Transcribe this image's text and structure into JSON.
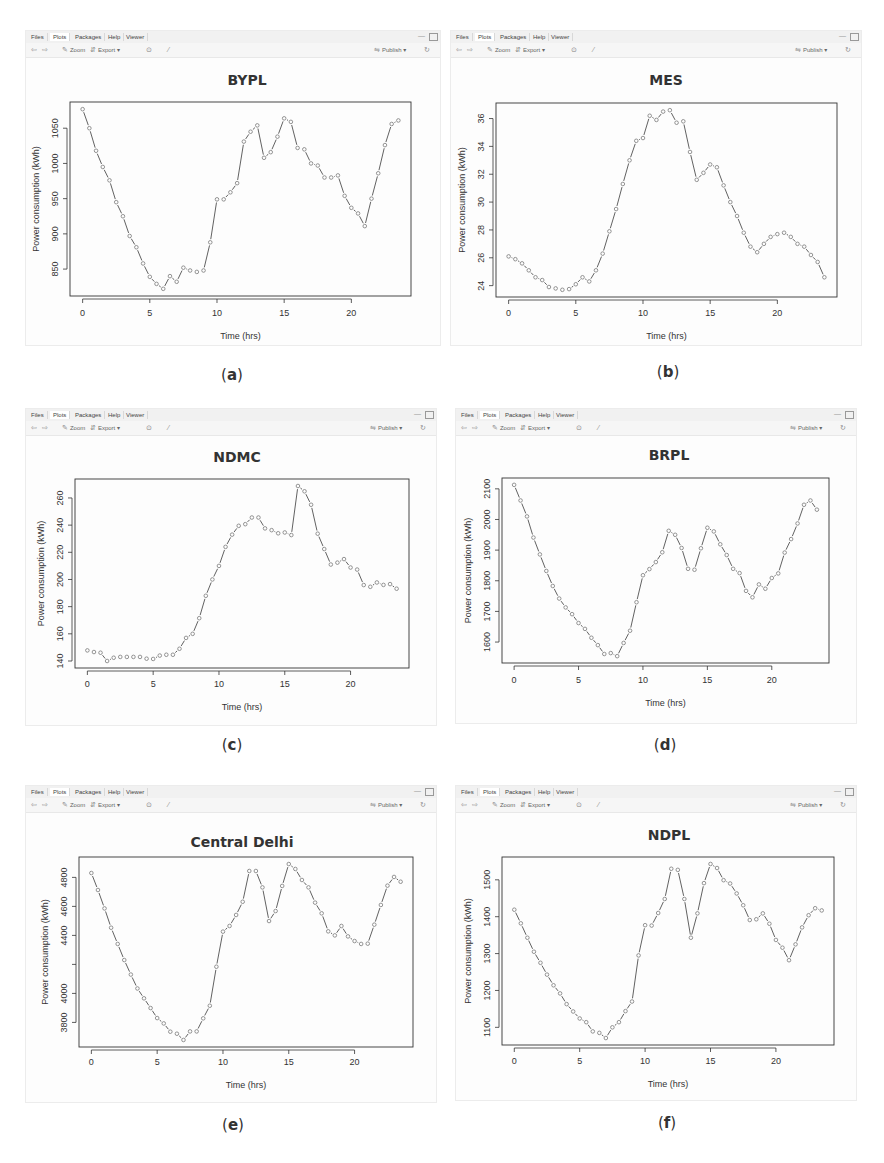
{
  "toolbar": {
    "tabs": [
      "Files",
      "Plots",
      "Packages",
      "Help",
      "Viewer"
    ],
    "active_tab": "Plots",
    "zoom_label": "Zoom",
    "export_label": "Export",
    "publish_label": "Publish",
    "dropdown_caret": "▾",
    "icons": {
      "back": "⇦",
      "forward": "⇨",
      "zoom": "✎",
      "export": "⇵",
      "remove": "⊙",
      "clear": "⁄",
      "publish": "⇋",
      "refresh": "↻",
      "minimize": "—"
    }
  },
  "panels": [
    {
      "caption": "a",
      "title": "BYPL"
    },
    {
      "caption": "b",
      "title": "MES"
    },
    {
      "caption": "c",
      "title": "NDMC"
    },
    {
      "caption": "d",
      "title": "BRPL"
    },
    {
      "caption": "e",
      "title": "Central Delhi"
    },
    {
      "caption": "f",
      "title": "NDPL"
    }
  ],
  "colors": {
    "line": "#3a3a3a",
    "point": "#7a7a7a",
    "axis": "#333333",
    "text": "#333333"
  },
  "chart_data": [
    {
      "type": "line",
      "title": "BYPL",
      "xlabel": "Time (hrs)",
      "ylabel": "Power consumption (kWh)",
      "x_ticks": [
        0,
        5,
        10,
        15,
        20
      ],
      "y_ticks": [
        850,
        900,
        950,
        1000,
        1050
      ],
      "y_tick_labels": [
        "850",
        "900",
        "950",
        "1000",
        "1050"
      ],
      "x": [
        0,
        0.5,
        1,
        1.5,
        2,
        2.5,
        3,
        3.5,
        4,
        4.5,
        5,
        5.5,
        6,
        6.5,
        7,
        7.5,
        8,
        8.5,
        9,
        9.5,
        10,
        10.5,
        11,
        11.5,
        12,
        12.5,
        13,
        13.5,
        14,
        14.5,
        15,
        15.5,
        16,
        16.5,
        17,
        17.5,
        18,
        18.5,
        19,
        19.5,
        20,
        20.5,
        21,
        21.5,
        22,
        22.5,
        23,
        23.5
      ],
      "values": [
        1077,
        1050,
        1018,
        995,
        976,
        945,
        925,
        897,
        881,
        858,
        839,
        829,
        822,
        840,
        832,
        852,
        848,
        846,
        848,
        888,
        949,
        949,
        959,
        972,
        1031,
        1045,
        1054,
        1008,
        1016,
        1038,
        1064,
        1059,
        1022,
        1020,
        1000,
        997,
        980,
        980,
        983,
        954,
        937,
        929,
        911,
        950,
        986,
        1026,
        1056,
        1061
      ],
      "grid": false,
      "legend": false
    },
    {
      "type": "line",
      "title": "MES",
      "xlabel": "Time (hrs)",
      "ylabel": "Power consumption (kWh)",
      "x_ticks": [
        0,
        5,
        10,
        15,
        20
      ],
      "y_ticks": [
        24,
        26,
        28,
        30,
        32,
        34,
        36
      ],
      "y_tick_labels": [
        "24",
        "26",
        "28",
        "30",
        "32",
        "34",
        "36"
      ],
      "x": [
        0,
        0.5,
        1,
        1.5,
        2,
        2.5,
        3,
        3.5,
        4,
        4.5,
        5,
        5.5,
        6,
        6.5,
        7,
        7.5,
        8,
        8.5,
        9,
        9.5,
        10,
        10.5,
        11,
        11.5,
        12,
        12.5,
        13,
        13.5,
        14,
        14.5,
        15,
        15.5,
        16,
        16.5,
        17,
        17.5,
        18,
        18.5,
        19,
        19.5,
        20,
        20.5,
        21,
        21.5,
        22,
        22.5,
        23,
        23.5
      ],
      "values": [
        26.1,
        25.9,
        25.6,
        25.1,
        24.6,
        24.4,
        23.9,
        23.8,
        23.7,
        23.75,
        24.1,
        24.6,
        24.3,
        25.1,
        26.3,
        27.9,
        29.5,
        31.3,
        33.0,
        34.4,
        34.6,
        36.2,
        35.9,
        36.5,
        36.6,
        35.7,
        35.8,
        33.6,
        31.6,
        32.1,
        32.7,
        32.5,
        31.2,
        30.0,
        29.0,
        27.8,
        26.8,
        26.4,
        27.0,
        27.5,
        27.7,
        27.8,
        27.5,
        27.0,
        26.8,
        26.2,
        25.7,
        24.6
      ],
      "grid": false,
      "legend": false
    },
    {
      "type": "line",
      "title": "NDMC",
      "xlabel": "Time (hrs)",
      "ylabel": "Power consumption (kWh)",
      "x_ticks": [
        0,
        5,
        10,
        15,
        20
      ],
      "y_ticks": [
        140,
        160,
        180,
        200,
        220,
        240,
        260
      ],
      "y_tick_labels": [
        "140",
        "160",
        "180",
        "200",
        "220",
        "240",
        "260"
      ],
      "x": [
        0,
        0.5,
        1,
        1.5,
        2,
        2.5,
        3,
        3.5,
        4,
        4.5,
        5,
        5.5,
        6,
        6.5,
        7,
        7.5,
        8,
        8.5,
        9,
        9.5,
        10,
        10.5,
        11,
        11.5,
        12,
        12.5,
        13,
        13.5,
        14,
        14.5,
        15,
        15.5,
        16,
        16.5,
        17,
        17.5,
        18,
        18.5,
        19,
        19.5,
        20,
        20.5,
        21,
        21.5,
        22,
        22.5,
        23,
        23.5
      ],
      "values": [
        147.8,
        146.6,
        146.1,
        140,
        142.4,
        143,
        143,
        143,
        143,
        141.7,
        141.5,
        144,
        144.6,
        144.6,
        149,
        157,
        160,
        171.5,
        188,
        200,
        210,
        224,
        233,
        239.5,
        240.7,
        245.6,
        245.6,
        237.6,
        236.3,
        234,
        234.6,
        232.7,
        268.8,
        264.9,
        255,
        233.7,
        222.4,
        211,
        212.4,
        215,
        208.8,
        207.3,
        195.9,
        194.6,
        197.8,
        196,
        196.6,
        193.2
      ],
      "grid": false,
      "legend": false
    },
    {
      "type": "line",
      "title": "BRPL",
      "xlabel": "Time (hrs)",
      "ylabel": "Power consumption (kWh)",
      "x_ticks": [
        0,
        5,
        10,
        15,
        20
      ],
      "y_ticks": [
        1600,
        1700,
        1800,
        1900,
        2000,
        2100
      ],
      "y_tick_labels": [
        "1600",
        "1700",
        "1800",
        "1900",
        "2000",
        "2100"
      ],
      "x": [
        0,
        0.5,
        1,
        1.5,
        2,
        2.5,
        3,
        3.5,
        4,
        4.5,
        5,
        5.5,
        6,
        6.5,
        7,
        7.5,
        8,
        8.5,
        9,
        9.5,
        10,
        10.5,
        11,
        11.5,
        12,
        12.5,
        13,
        13.5,
        14,
        14.5,
        15,
        15.5,
        16,
        16.5,
        17,
        17.5,
        18,
        18.5,
        19,
        19.5,
        20,
        20.5,
        21,
        21.5,
        22,
        22.5,
        23,
        23.5
      ],
      "values": [
        2113,
        2062,
        2010,
        1941,
        1886,
        1832,
        1783,
        1742,
        1713,
        1691,
        1662,
        1643,
        1614,
        1590,
        1561,
        1564,
        1554,
        1597,
        1637,
        1730,
        1818,
        1838,
        1861,
        1893,
        1963,
        1950,
        1907,
        1839,
        1836,
        1906,
        1973,
        1961,
        1919,
        1884,
        1839,
        1825,
        1767,
        1746,
        1788,
        1774,
        1809,
        1824,
        1892,
        1936,
        1987,
        2048,
        2062,
        2032
      ],
      "grid": false,
      "legend": false
    },
    {
      "type": "line",
      "title": "Central Delhi",
      "xlabel": "Time (hrs)",
      "ylabel": "Power consumption (kWh)",
      "x_ticks": [
        0,
        5,
        10,
        15,
        20
      ],
      "y_ticks": [
        3800,
        4000,
        4200,
        4400,
        4600,
        4800
      ],
      "y_tick_labels": [
        "3800",
        "4000",
        "",
        "4400",
        "4600",
        "4800"
      ],
      "x": [
        0,
        0.5,
        1,
        1.5,
        2,
        2.5,
        3,
        3.5,
        4,
        4.5,
        5,
        5.5,
        6,
        6.5,
        7,
        7.5,
        8,
        8.5,
        9,
        9.5,
        10,
        10.5,
        11,
        11.5,
        12,
        12.5,
        13,
        13.5,
        14,
        14.5,
        15,
        15.5,
        16,
        16.5,
        17,
        17.5,
        18,
        18.5,
        19,
        19.5,
        20,
        20.5,
        21,
        21.5,
        22,
        22.5,
        23,
        23.5
      ],
      "values": [
        4830,
        4713,
        4586,
        4453,
        4341,
        4230,
        4130,
        4034,
        3966,
        3899,
        3830,
        3793,
        3736,
        3722,
        3679,
        3738,
        3738,
        3828,
        3915,
        4184,
        4426,
        4465,
        4541,
        4632,
        4844,
        4844,
        4731,
        4499,
        4568,
        4741,
        4892,
        4858,
        4782,
        4731,
        4626,
        4552,
        4428,
        4400,
        4465,
        4393,
        4361,
        4341,
        4343,
        4474,
        4610,
        4743,
        4803,
        4770
      ],
      "grid": false,
      "legend": false
    },
    {
      "type": "line",
      "title": "NDPL",
      "xlabel": "Time (hrs)",
      "ylabel": "Power consumption (kWh)",
      "x_ticks": [
        0,
        5,
        10,
        15,
        20
      ],
      "y_ticks": [
        1100,
        1200,
        1300,
        1400,
        1500
      ],
      "y_tick_labels": [
        "1100",
        "1200",
        "1300",
        "1400",
        "1500"
      ],
      "x": [
        0,
        0.5,
        1,
        1.5,
        2,
        2.5,
        3,
        3.5,
        4,
        4.5,
        5,
        5.5,
        6,
        6.5,
        7,
        7.5,
        8,
        8.5,
        9,
        9.5,
        10,
        10.5,
        11,
        11.5,
        12,
        12.5,
        13,
        13.5,
        14,
        14.5,
        15,
        15.5,
        16,
        16.5,
        17,
        17.5,
        18,
        18.5,
        19,
        19.5,
        20,
        20.5,
        21,
        21.5,
        22,
        22.5,
        23,
        23.5
      ],
      "values": [
        1419,
        1382,
        1343,
        1305,
        1275,
        1243,
        1214,
        1192,
        1163,
        1143,
        1124,
        1114,
        1089,
        1085,
        1071,
        1100,
        1114,
        1144,
        1170,
        1295,
        1377,
        1376,
        1410,
        1448,
        1530,
        1527,
        1448,
        1343,
        1409,
        1491,
        1543,
        1532,
        1499,
        1490,
        1463,
        1431,
        1391,
        1393,
        1409,
        1381,
        1337,
        1316,
        1282,
        1325,
        1371,
        1404,
        1423,
        1417
      ],
      "grid": false,
      "legend": false
    }
  ]
}
